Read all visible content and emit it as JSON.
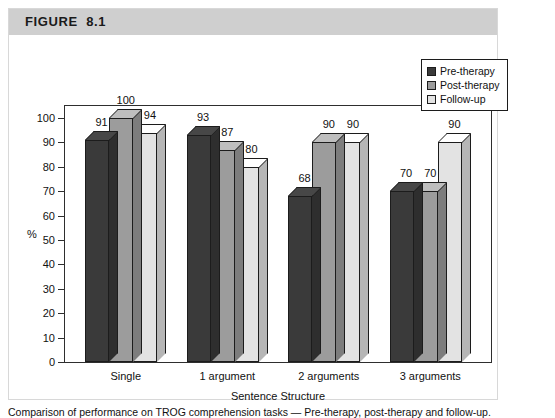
{
  "figure": {
    "header_label": "FIGURE  8.1"
  },
  "legend": {
    "items": [
      {
        "label": "Pre-therapy",
        "color": "#3a3a3a"
      },
      {
        "label": "Post-therapy",
        "color": "#9c9c9c"
      },
      {
        "label": "Follow-up",
        "color": "#e3e3e3"
      }
    ]
  },
  "axes": {
    "y_title": "%",
    "x_title": "Sentence Structure",
    "y_ticks": [
      "0",
      "10",
      "20",
      "30",
      "40",
      "50",
      "60",
      "70",
      "80",
      "90",
      "100"
    ]
  },
  "chart_data": {
    "type": "bar",
    "title": "FIGURE  8.1",
    "xlabel": "Sentence Structure",
    "ylabel": "%",
    "ylim": [
      0,
      100
    ],
    "ytick_step": 10,
    "grid": false,
    "legend_position": "top-right",
    "style": "3d-clustered-column",
    "categories": [
      "Single",
      "1 argument",
      "2 arguments",
      "3 arguments"
    ],
    "series": [
      {
        "name": "Pre-therapy",
        "color": "#3a3a3a",
        "values": [
          91,
          93,
          68,
          70
        ]
      },
      {
        "name": "Post-therapy",
        "color": "#9c9c9c",
        "values": [
          100,
          87,
          90,
          70
        ]
      },
      {
        "name": "Follow-up",
        "color": "#e3e3e3",
        "values": [
          94,
          80,
          90,
          90
        ]
      }
    ],
    "data_labels": [
      [
        91,
        100,
        94
      ],
      [
        93,
        87,
        80
      ],
      [
        68,
        90,
        90
      ],
      [
        70,
        70,
        90
      ]
    ]
  },
  "caption": {
    "text": "Comparison of performance on TROG comprehension tasks — Pre-therapy, post-therapy and follow-up."
  }
}
